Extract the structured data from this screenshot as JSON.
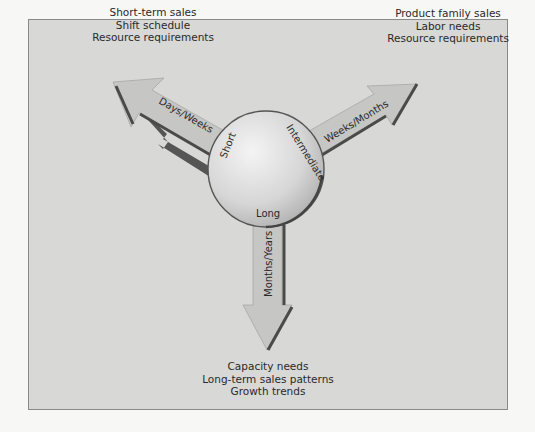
{
  "diagram": {
    "center": {
      "segments": [
        "Short",
        "Intermediate",
        "Long"
      ]
    },
    "arrows": [
      {
        "id": "short",
        "horizon": "Short",
        "duration": "Days/Weeks",
        "direction": "upper-left",
        "uses": [
          "Short-term sales",
          "Shift schedule",
          "Resource requirements"
        ]
      },
      {
        "id": "intermediate",
        "horizon": "Intermediate",
        "duration": "Weeks/Months",
        "direction": "upper-right",
        "uses": [
          "Product family sales",
          "Labor needs",
          "Resource requirements"
        ]
      },
      {
        "id": "long",
        "horizon": "Long",
        "duration": "Months/Years",
        "direction": "down",
        "uses": [
          "Capacity needs",
          "Long-term sales patterns",
          "Growth trends"
        ]
      }
    ],
    "colors": {
      "frame_bg": "#d8d8d6",
      "arrow_fill": "#c4c4c2",
      "arrow_shadow": "#555555",
      "circle_light": "#f2f2f2",
      "circle_dark": "#b5b5b5"
    }
  }
}
